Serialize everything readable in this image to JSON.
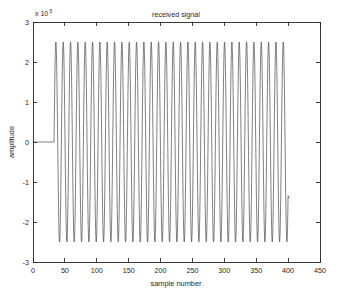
{
  "figure": {
    "title": "received signal",
    "background_color": "#ffffff",
    "axis_color": "#262626",
    "line_color": "#3a3a3a"
  },
  "axes": {
    "y_exponent_prefix": "x 10",
    "y_exponent_value": "5",
    "x_label": "sample number",
    "y_label": "amplitude",
    "x_ticks": [
      0,
      50,
      100,
      150,
      200,
      250,
      300,
      350,
      400,
      450
    ],
    "y_ticks": [
      3,
      2,
      1,
      0,
      -1,
      -2,
      -3
    ],
    "x_tick_labels": [
      "0",
      "50",
      "100",
      "150",
      "200",
      "250",
      "300",
      "350",
      "400",
      "450"
    ],
    "y_tick_labels": [
      "3",
      "2",
      "1",
      "0",
      "-1",
      "-2",
      "-3"
    ],
    "xlim": [
      0,
      450
    ],
    "ylim": [
      -3,
      3
    ],
    "grid": false,
    "box": true
  },
  "chart_data": {
    "type": "line",
    "title": "received signal",
    "xlabel": "sample number",
    "ylabel": "amplitude",
    "y_scale_exponent": 5,
    "xlim": [
      0,
      450
    ],
    "ylim": [
      -3,
      3
    ],
    "grid": false,
    "legend": null,
    "series": [
      {
        "name": "received signal",
        "description": "Flat zero baseline for samples 0-33, then a sustained sinusoidal burst of amplitude 2.5e5 from sample 33 to 400, ending with a partial downstroke to -1.4e5 near sample 402.",
        "segments": [
          {
            "name": "silent-baseline",
            "x_start": 0,
            "x_end": 33,
            "value": 0
          },
          {
            "name": "sinusoid-burst",
            "x_start": 33,
            "x_end": 400,
            "amplitude": 2.5,
            "period_samples": 11.5,
            "cycles": 32,
            "phase": 0
          },
          {
            "name": "trailing-partial",
            "x_start": 400,
            "x_end": 402,
            "end_value": -1.4
          }
        ],
        "x": [
          0,
          5,
          10,
          15,
          20,
          25,
          30,
          33,
          38.75,
          44.5,
          50.25,
          56,
          61.75,
          67.5,
          73.25,
          79,
          84.75,
          90.5,
          96.25,
          102,
          107.75,
          113.5,
          119.25,
          125,
          130.75,
          136.5,
          142.25,
          148,
          153.75,
          159.5,
          165.25,
          171,
          176.75,
          182.5,
          188.25,
          194,
          199.75,
          205.5,
          211.25,
          217,
          222.75,
          228.5,
          234.25,
          240,
          245.75,
          251.5,
          257.25,
          263,
          268.75,
          274.5,
          280.25,
          286,
          291.75,
          297.5,
          303.25,
          309,
          314.75,
          320.5,
          326.25,
          332,
          337.75,
          343.5,
          349.25,
          355,
          360.75,
          366.5,
          372.25,
          378,
          383.75,
          389.5,
          395.25,
          400,
          402
        ],
        "y": [
          0,
          0,
          0,
          0,
          0,
          0,
          0,
          0,
          2.5,
          -2.5,
          2.5,
          -2.5,
          2.5,
          -2.5,
          2.5,
          -2.5,
          2.5,
          -2.5,
          2.5,
          -2.5,
          2.5,
          -2.5,
          2.5,
          -2.5,
          2.5,
          -2.5,
          2.5,
          -2.5,
          2.5,
          -2.5,
          2.5,
          -2.5,
          2.5,
          -2.5,
          2.5,
          -2.5,
          2.5,
          -2.5,
          2.5,
          -2.5,
          2.5,
          -2.5,
          2.5,
          -2.5,
          2.5,
          -2.5,
          2.5,
          -2.5,
          2.5,
          -2.5,
          2.5,
          -2.5,
          2.5,
          -2.5,
          2.5,
          -2.5,
          2.5,
          -2.5,
          2.5,
          -2.5,
          2.5,
          -2.5,
          2.5,
          -2.5,
          2.5,
          -2.5,
          2.5,
          -2.5,
          2.5,
          -2.5,
          2.5,
          -2.5,
          -1.4
        ]
      }
    ]
  }
}
